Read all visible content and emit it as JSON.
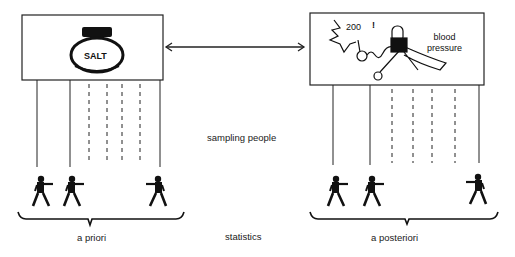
{
  "diagram": {
    "left_box": {
      "label": "SALT",
      "icon": "salt-jar"
    },
    "right_box": {
      "reading": "200",
      "exclaim": "!",
      "label_line1": "blood",
      "label_line2": "pressure",
      "icon": "blood-pressure-cuff"
    },
    "connector": "double-arrow",
    "middle_label": "sampling people",
    "bottom_label": "statistics",
    "left_group_label": "a priori",
    "right_group_label": "a posteriori",
    "left_lines": {
      "solid": 3,
      "dashed": 4
    },
    "right_lines": {
      "solid": 3,
      "dashed": 4
    },
    "people_per_group": 3
  }
}
